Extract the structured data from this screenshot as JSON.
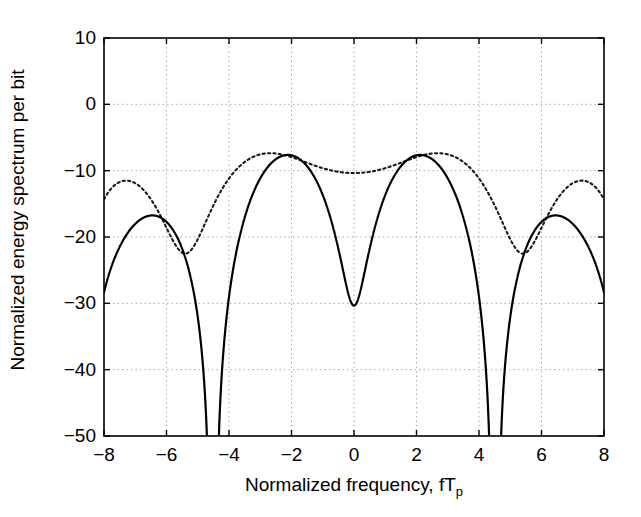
{
  "chart_data": {
    "type": "line",
    "title": "",
    "xlabel": "Normalized frequency, fTp",
    "xlabel_main": "Normalized frequency, fT",
    "xlabel_sub": "p",
    "ylabel": "Normalized energy spectrum per bit",
    "xlim": [
      -8,
      8
    ],
    "ylim": [
      -50,
      10
    ],
    "xticks": [
      -8,
      -6,
      -4,
      -2,
      0,
      2,
      4,
      6,
      8
    ],
    "xtick_labels": [
      "-8",
      "-6",
      "-4",
      "-2",
      "0",
      "2",
      "4",
      "6",
      "8"
    ],
    "yticks": [
      10,
      0,
      -10,
      -20,
      -30,
      -40,
      -50
    ],
    "ytick_labels": [
      "10",
      "0",
      "-10",
      "-20",
      "-30",
      "-40",
      "-50"
    ],
    "grid": true,
    "grid_style": "dotted",
    "grid_color": "#aaaaaa",
    "legend": "none",
    "background": "#ffffff",
    "axis_color": "#000000",
    "series": [
      {
        "name": "solid-curve",
        "style": "solid",
        "color": "#000000",
        "width": 2.0,
        "description": "Multi-lobe energy spectrum, solid line",
        "lobe_peaks_x": [
          -7.5,
          -7.0,
          -6.0,
          -5.0,
          -4.4,
          -3.2,
          -2.6,
          -2.0,
          -1.4,
          -0.8,
          -0.4,
          0.0,
          0.4,
          0.8,
          1.4,
          2.0,
          2.6,
          3.2,
          4.4,
          5.0,
          6.0,
          7.0,
          7.5
        ],
        "lobe_peaks_y": [
          -22,
          -20,
          -10,
          -17,
          -20,
          -22,
          -17,
          0,
          -7,
          -2,
          -3,
          -2.5,
          -3,
          -2,
          -7,
          0,
          -17,
          -22,
          -20,
          -17,
          -10,
          -20,
          -22
        ],
        "null_depth_db": -50
      },
      {
        "name": "dotted-curve",
        "style": "dotted",
        "color": "#333333",
        "width": 2.0,
        "description": "Multi-lobe energy spectrum, dotted line, broader envelope",
        "lobe_peaks_x": [
          -7.6,
          -6.9,
          -6.0,
          -5.1,
          -4.3,
          -3.3,
          -2.5,
          -1.9,
          -1.3,
          -0.7,
          0.0,
          0.7,
          1.3,
          1.9,
          2.5,
          3.3,
          4.3,
          5.1,
          6.0,
          6.9,
          7.6
        ],
        "lobe_peaks_y": [
          -26,
          -19,
          -7,
          -13,
          -19,
          -18,
          -10,
          2,
          -4,
          -2,
          -2,
          -2,
          -4,
          2,
          -10,
          -18,
          -19,
          -13,
          -7,
          -19,
          -26
        ],
        "null_depth_db": -50
      }
    ]
  }
}
